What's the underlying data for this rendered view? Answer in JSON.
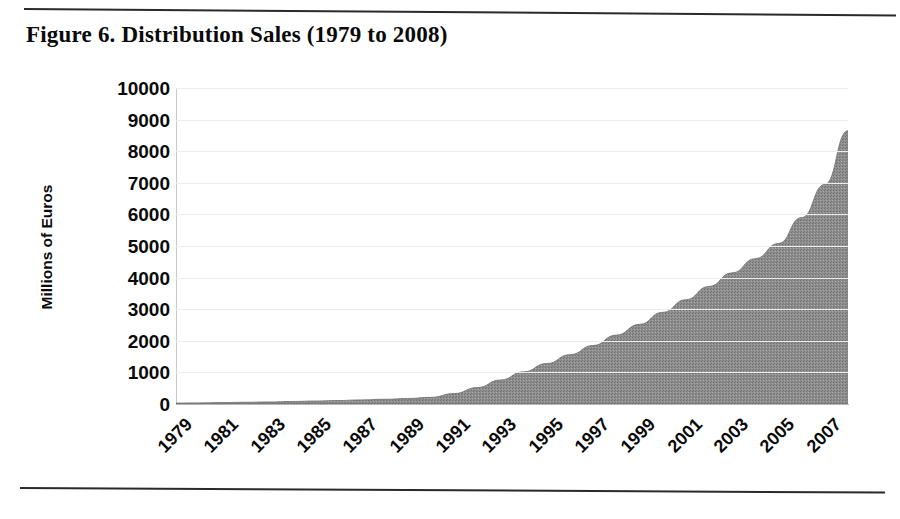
{
  "figure": {
    "title": "Figure 6. Distribution Sales (1979 to 2008)"
  },
  "rules": {
    "top": "horizontal-rule",
    "bottom": "horizontal-rule"
  },
  "chart_data": {
    "type": "area",
    "title": "Figure 6. Distribution Sales (1979 to 2008)",
    "xlabel": "",
    "ylabel": "Millions of Euros",
    "ylim": [
      0,
      10000
    ],
    "ytick_values": [
      10000,
      9000,
      8000,
      7000,
      6000,
      5000,
      4000,
      3000,
      2000,
      1000,
      0
    ],
    "ytick_labels": [
      "10000",
      "9000",
      "8000",
      "7000",
      "6000",
      "5000",
      "4000",
      "3000",
      "2000",
      "1000",
      "0"
    ],
    "xtick_labels": [
      "1979",
      "1981",
      "1983",
      "1985",
      "1987",
      "1989",
      "1991",
      "1993",
      "1995",
      "1997",
      "1999",
      "2001",
      "2003",
      "2005",
      "2007"
    ],
    "xtick_rotation": -45,
    "grid": true,
    "legend": "none",
    "fill_color": "#8a8a8a",
    "x": [
      1979,
      1980,
      1981,
      1982,
      1983,
      1984,
      1985,
      1986,
      1987,
      1988,
      1989,
      1990,
      1991,
      1992,
      1993,
      1994,
      1995,
      1996,
      1997,
      1998,
      1999,
      2000,
      2001,
      2002,
      2003,
      2004,
      2005,
      2006,
      2007,
      2008
    ],
    "series": [
      {
        "name": "Distribution Sales",
        "values": [
          30,
          35,
          45,
          55,
          65,
          80,
          95,
          110,
          130,
          150,
          175,
          210,
          330,
          520,
          760,
          1020,
          1280,
          1560,
          1850,
          2180,
          2520,
          2900,
          3300,
          3720,
          4150,
          4600,
          5080,
          5900,
          6950,
          8650
        ]
      }
    ]
  }
}
